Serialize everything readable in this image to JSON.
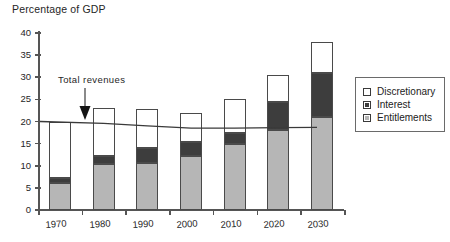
{
  "chart_data": {
    "type": "bar",
    "title": "Percentage of GDP",
    "xlabel": "",
    "ylabel": "Percentage of GDP",
    "ylim": [
      0,
      40
    ],
    "ytick_step": 5,
    "yticks": [
      0,
      5,
      10,
      15,
      20,
      25,
      30,
      35,
      40
    ],
    "grid": false,
    "stacked": true,
    "legend_position": "right",
    "categories": [
      "1970",
      "1980",
      "1990",
      "2000",
      "2010",
      "2020",
      "2030"
    ],
    "series": [
      {
        "name": "Entitlements",
        "values": [
          6.0,
          10.3,
          10.6,
          12.3,
          15.0,
          18.0,
          21.0
        ],
        "color": "#b6b6b6"
      },
      {
        "name": "Interest",
        "values": [
          1.2,
          1.9,
          3.4,
          3.0,
          2.3,
          6.5,
          10.0
        ],
        "color": "#3d3d3d"
      },
      {
        "name": "Discretionary",
        "values": [
          12.8,
          10.8,
          8.8,
          6.7,
          7.7,
          6.0,
          7.0
        ],
        "color": "#ffffff"
      }
    ],
    "totals": [
      20.0,
      23.0,
      22.8,
      22.0,
      25.0,
      30.5,
      38.0
    ],
    "overlay_line": {
      "name": "Total revenues",
      "x": [
        "1970",
        "1980",
        "1990",
        "2000",
        "2010",
        "2020",
        "2030"
      ],
      "values": [
        20.0,
        19.6,
        19.0,
        18.5,
        18.5,
        18.6,
        18.7
      ],
      "color": "#3a3a3a"
    },
    "annotations": [
      {
        "text": "Total  revenues",
        "points_to": "overlay_line",
        "x": "1975",
        "y": 29.5
      }
    ]
  },
  "legend": {
    "entries": [
      {
        "label": "Discretionary",
        "swatch": "white"
      },
      {
        "label": "Interest",
        "swatch": "dark-gray"
      },
      {
        "label": "Entitlements",
        "swatch": "light-gray"
      }
    ]
  },
  "axis": {
    "y_labels": [
      "40",
      "35",
      "30",
      "25",
      "20",
      "15",
      "10",
      "5",
      "0"
    ],
    "x_labels": [
      "1970",
      "1980",
      "1990",
      "2000",
      "2010",
      "2020",
      "2030"
    ]
  },
  "colors": {
    "entitlements": "#b6b6b6",
    "interest": "#3d3d3d",
    "discretionary": "#ffffff",
    "axis": "#555555",
    "line": "#3a3a3a",
    "text": "#262626"
  }
}
